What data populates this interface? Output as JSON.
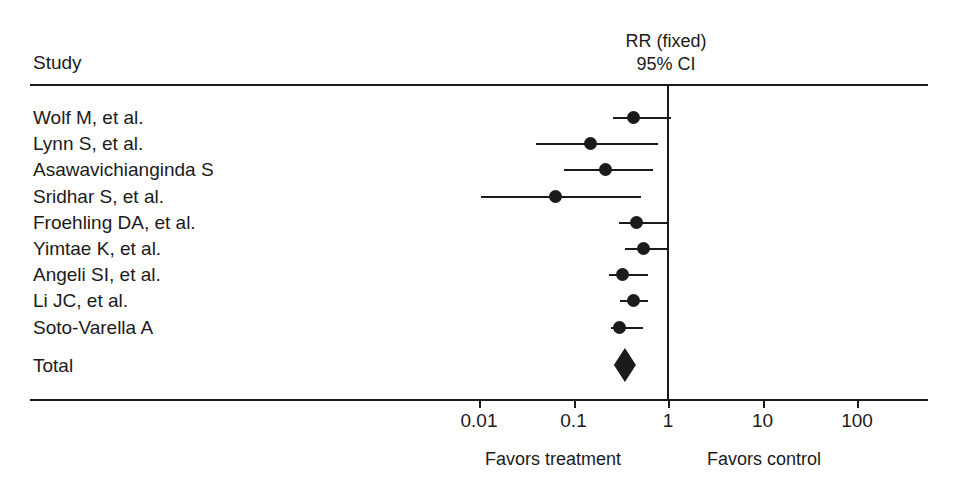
{
  "header": {
    "study_column_label": "Study",
    "effect_line1": "RR (fixed)",
    "effect_line2": "95% CI"
  },
  "footer": {
    "left_label": "Favors treatment",
    "right_label": "Favors control"
  },
  "colors": {
    "foreground": "#1b1b1b",
    "background": "#ffffff"
  },
  "chart_data": {
    "type": "forest",
    "title": "",
    "effect_measure": "RR (fixed)",
    "confidence_level": "95% CI",
    "xlabel": "",
    "ylabel": "",
    "x_scale": "log",
    "xlim": [
      0.0025,
      800
    ],
    "grid": false,
    "no_effect_line": 1,
    "favors_left": "Favors treatment",
    "favors_right": "Favors control",
    "tick_values": [
      0.01,
      0.1,
      1,
      10,
      100
    ],
    "tick_labels": [
      "0.01",
      "0.1",
      "1",
      "10",
      "100"
    ],
    "studies": [
      {
        "label": "Wolf M, et al.",
        "rr": 0.43,
        "ci_low": 0.26,
        "ci_high": 1.07
      },
      {
        "label": "Lynn S, et al.",
        "rr": 0.15,
        "ci_low": 0.04,
        "ci_high": 0.78
      },
      {
        "label": "Asawavichianginda S",
        "rr": 0.22,
        "ci_low": 0.08,
        "ci_high": 0.69
      },
      {
        "label": "Sridhar S, et al.",
        "rr": 0.065,
        "ci_low": 0.0105,
        "ci_high": 0.52
      },
      {
        "label": "Froehling DA, et al.",
        "rr": 0.46,
        "ci_low": 0.3,
        "ci_high": 1.03
      },
      {
        "label": "Yimtae K, et al.",
        "rr": 0.55,
        "ci_low": 0.35,
        "ci_high": 1.01
      },
      {
        "label": "Angeli SI, et al.",
        "rr": 0.33,
        "ci_low": 0.24,
        "ci_high": 0.61
      },
      {
        "label": "Li JC, et al.",
        "rr": 0.43,
        "ci_low": 0.31,
        "ci_high": 0.62
      },
      {
        "label": "Soto-Varella A",
        "rr": 0.31,
        "ci_low": 0.25,
        "ci_high": 0.55
      }
    ],
    "total": {
      "label": "Total",
      "rr": 0.35,
      "ci_low": 0.29,
      "ci_high": 0.42
    }
  }
}
